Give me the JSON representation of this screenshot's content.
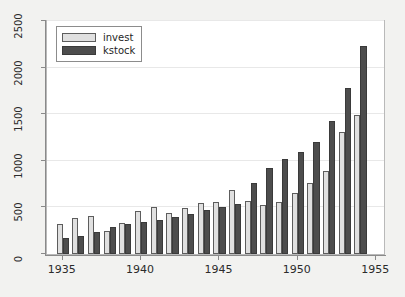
{
  "chart_data": {
    "type": "bar",
    "title": "",
    "xlabel": "",
    "ylabel": "",
    "categories": [
      1935,
      1936,
      1937,
      1938,
      1939,
      1940,
      1941,
      1942,
      1943,
      1944,
      1945,
      1946,
      1947,
      1948,
      1949,
      1950,
      1951,
      1952,
      1953,
      1954
    ],
    "series": [
      {
        "name": "invest",
        "color": "#e0e0e0",
        "values": [
          317,
          391,
          411,
          251,
          336,
          458,
          508,
          441,
          496,
          543,
          555,
          690,
          565,
          522,
          558,
          651,
          757,
          889,
          1305,
          1493
        ]
      },
      {
        "name": "kstock",
        "color": "#4d4d4d",
        "values": [
          173,
          197,
          240,
          287,
          320,
          342,
          366,
          392,
          424,
          467,
          500,
          532,
          766,
          922,
          1021,
          1094,
          1207,
          1430,
          1778,
          2227
        ]
      }
    ],
    "xlim": [
      1934,
      1955.5
    ],
    "ylim": [
      0,
      2500
    ],
    "y_ticks": [
      0,
      500,
      1000,
      1500,
      2000,
      2500
    ],
    "x_ticks": [
      1935,
      1940,
      1945,
      1950,
      1955
    ],
    "grid": true,
    "grid_axis": "y",
    "legend_position": "upper left",
    "background": "#f2f2f0",
    "plot_background": "#ffffff",
    "gridline_color": "#e8e8e8",
    "axis_color": "#8a8a8a"
  },
  "legend": {
    "items": [
      {
        "label": "invest"
      },
      {
        "label": "kstock"
      }
    ]
  },
  "y_tick_labels": [
    "0",
    "500",
    "1000",
    "1500",
    "2000",
    "2500"
  ],
  "x_tick_labels": [
    "1935",
    "1940",
    "1945",
    "1950",
    "1955"
  ]
}
